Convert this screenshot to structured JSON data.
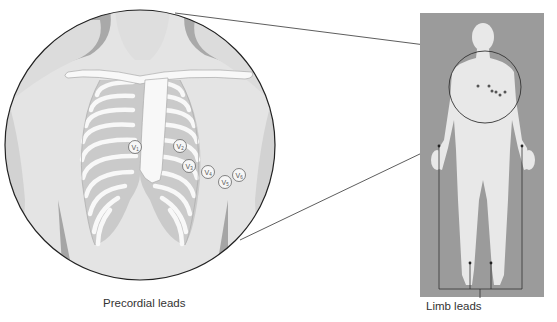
{
  "diagram": {
    "labels": {
      "precordial": "Precordial leads",
      "limb": "Limb leads"
    },
    "electrodes": [
      {
        "letter": "V",
        "sub": "1"
      },
      {
        "letter": "V",
        "sub": "2"
      },
      {
        "letter": "V",
        "sub": "3"
      },
      {
        "letter": "V",
        "sub": "4"
      },
      {
        "letter": "V",
        "sub": "5"
      },
      {
        "letter": "V",
        "sub": "6"
      }
    ],
    "colors": {
      "background_panel": "#9a9a9a",
      "body": "#e6e6e6",
      "skin_shadow": "#a8a8a8",
      "rib_fill": "#c9c9c9",
      "bone": "#f8f8f8",
      "outline": "#222222"
    }
  }
}
